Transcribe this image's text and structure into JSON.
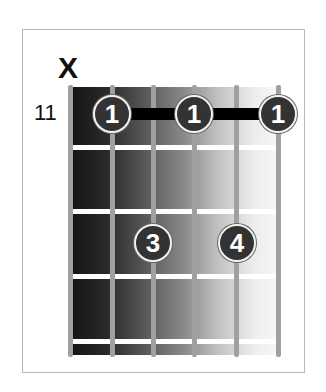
{
  "diagram": {
    "type": "guitar-chord-diagram",
    "muted_string_marker": "X",
    "muted_string": 1,
    "start_fret_label": "11",
    "strings": 6,
    "frets_shown": 4,
    "barre": {
      "finger": "1",
      "fret_row": 1,
      "from_string": 2,
      "to_string": 6
    },
    "fingers": [
      {
        "label": "1",
        "string": 2,
        "fret_row": 1
      },
      {
        "label": "1",
        "string": 4,
        "fret_row": 1
      },
      {
        "label": "1",
        "string": 6,
        "fret_row": 1
      },
      {
        "label": "3",
        "string": 3,
        "fret_row": 3
      },
      {
        "label": "4",
        "string": 5,
        "fret_row": 3
      }
    ],
    "colors": {
      "finger_fill": "#333333",
      "finger_ring": "#f2f2f2",
      "barre": "#000000",
      "string": "#a0a0a0",
      "fret": "#ffffff",
      "board_dark": "#141414",
      "board_light": "#f7f7f7"
    }
  }
}
